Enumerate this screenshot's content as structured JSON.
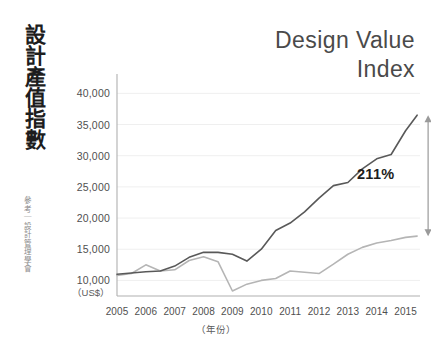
{
  "vertical_title": "設計產值指數",
  "source_note": "參考｜設計管理學會",
  "chart_title_line1": "Design Value",
  "chart_title_line2": "Index",
  "colors": {
    "dark_series": "#595959",
    "light_series": "#b5b5b5",
    "axis": "#b0b0b0",
    "gridline": "#efefef",
    "annotation_arrow": "#9a9a9a",
    "text": "#3a3a3a",
    "background": "#ffffff"
  },
  "annotation": {
    "label": "211%",
    "arrow": "double-headed-vertical"
  },
  "chart_data": {
    "type": "line",
    "title": "Design Value Index",
    "xlabel": "（年份）",
    "ylabel": "（US$）",
    "ylim": [
      7500,
      41500
    ],
    "xlim": [
      2005,
      2015.5
    ],
    "grid": true,
    "legend": "none",
    "yticks": [
      10000,
      15000,
      20000,
      25000,
      30000,
      35000,
      40000
    ],
    "ytick_labels": [
      "10,000",
      "15,000",
      "20,000",
      "25,000",
      "30,000",
      "35,000",
      "40,000"
    ],
    "xticks": [
      2005,
      2006,
      2007,
      2008,
      2009,
      2010,
      2011,
      2012,
      2013,
      2014,
      2015
    ],
    "xtick_labels": [
      "2005",
      "2006",
      "2007",
      "2008",
      "2009",
      "2010",
      "2011",
      "2012",
      "2013",
      "2014",
      "2015"
    ],
    "x": [
      2005,
      2005.5,
      2006,
      2006.5,
      2007,
      2007.5,
      2008,
      2008.5,
      2009,
      2009.5,
      2010,
      2010.5,
      2011,
      2011.5,
      2012,
      2012.5,
      2013,
      2013.5,
      2014,
      2014.5,
      2015,
      2015.4
    ],
    "series": [
      {
        "name": "Design Value Index (design-led)",
        "color": "#595959",
        "values": [
          11000,
          11200,
          11400,
          11500,
          12300,
          13700,
          14500,
          14500,
          14200,
          13100,
          15000,
          18000,
          19200,
          21000,
          23200,
          25200,
          25700,
          27900,
          29500,
          30200,
          34000,
          36500
        ]
      },
      {
        "name": "Benchmark index",
        "color": "#b5b5b5",
        "values": [
          10800,
          11100,
          12500,
          11500,
          11700,
          13200,
          13800,
          13000,
          8300,
          9400,
          10000,
          10300,
          11500,
          11300,
          11100,
          12600,
          14200,
          15300,
          16000,
          16400,
          16900,
          17100
        ]
      }
    ],
    "annotations": [
      {
        "text": "211%",
        "x": 2015.4,
        "y_top": 36500,
        "y_bottom": 17100,
        "type": "span-arrow"
      }
    ]
  }
}
